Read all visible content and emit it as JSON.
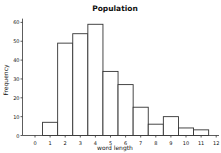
{
  "chart_data": {
    "type": "bar",
    "title": "Population",
    "xlabel": "word length",
    "ylabel": "Frequency",
    "categories": [
      "1",
      "2",
      "3",
      "4",
      "5",
      "6",
      "7",
      "8",
      "9",
      "10",
      "11"
    ],
    "values": [
      7,
      49,
      54,
      59,
      34,
      27,
      15,
      6,
      10,
      4,
      3
    ],
    "x_ticks": [
      "0",
      "1",
      "2",
      "3",
      "4",
      "5",
      "6",
      "7",
      "8",
      "9",
      "10",
      "11",
      "12"
    ],
    "y_ticks": [
      "0",
      "10",
      "20",
      "30",
      "40",
      "50",
      "60"
    ],
    "ylim": [
      0,
      62
    ],
    "xlim": [
      -0.9,
      12.3
    ],
    "grid": false,
    "legend": null,
    "bar_fill": "#ffffff",
    "bar_stroke": "#333333"
  }
}
